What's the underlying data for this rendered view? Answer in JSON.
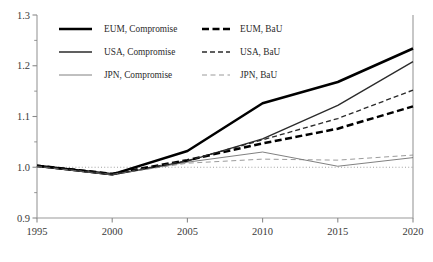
{
  "chart_data": {
    "type": "line",
    "title": "",
    "xlabel": "",
    "ylabel": "",
    "xlim": [
      1995,
      2020
    ],
    "ylim": [
      0.9,
      1.3
    ],
    "grid": false,
    "legend_position": "top-left",
    "x_ticks": [
      "1995",
      "2000",
      "2005",
      "2010",
      "2015",
      "2020"
    ],
    "x_tick_values": [
      1995,
      2000,
      2005,
      2010,
      2015,
      2020
    ],
    "y_ticks": [
      "0.9",
      "1.0",
      "1.1",
      "1.2",
      "1.3"
    ],
    "y_tick_values": [
      0.9,
      1.0,
      1.1,
      1.2,
      1.3
    ],
    "y_minor_tick_values": [
      0.95,
      1.05,
      1.15,
      1.25
    ],
    "reference_line": {
      "value": 1.0,
      "style": "dotted"
    },
    "x": [
      1995,
      2000,
      2005,
      2010,
      2015,
      2020
    ],
    "series": [
      {
        "name": "EUM, Compromise",
        "style": "solid",
        "width": "thick",
        "color": "#000000",
        "values": [
          1.003,
          0.986,
          1.032,
          1.126,
          1.168,
          1.234
        ]
      },
      {
        "name": "USA, Compromise",
        "style": "solid",
        "width": "medium",
        "color": "#2b2b2b",
        "values": [
          1.002,
          0.985,
          1.012,
          1.056,
          1.122,
          1.208
        ]
      },
      {
        "name": "JPN, Compromise",
        "style": "solid",
        "width": "thin",
        "color": "#555555",
        "values": [
          1.001,
          0.985,
          1.01,
          1.03,
          1.002,
          1.019
        ]
      },
      {
        "name": "EUM, BaU",
        "style": "dashed",
        "width": "thick",
        "color": "#000000",
        "values": [
          1.003,
          0.987,
          1.014,
          1.047,
          1.076,
          1.12
        ]
      },
      {
        "name": "USA, BaU",
        "style": "dashed",
        "width": "medium",
        "color": "#2b2b2b",
        "values": [
          1.002,
          0.986,
          1.013,
          1.054,
          1.096,
          1.152
        ]
      },
      {
        "name": "JPN, BaU",
        "style": "dashed",
        "width": "thin",
        "color": "#7a7a7a",
        "values": [
          1.001,
          0.986,
          1.008,
          1.016,
          1.014,
          1.024
        ]
      }
    ]
  },
  "legend": {
    "entries": [
      {
        "label": "EUM, Compromise",
        "column": 0,
        "row": 0
      },
      {
        "label": "USA, Compromise",
        "column": 0,
        "row": 1
      },
      {
        "label": "JPN, Compromise",
        "column": 0,
        "row": 2
      },
      {
        "label": "EUM, BaU",
        "column": 1,
        "row": 0
      },
      {
        "label": "USA, BaU",
        "column": 1,
        "row": 1
      },
      {
        "label": "JPN, BaU",
        "column": 1,
        "row": 2
      }
    ]
  },
  "axes": {
    "frame_color": "#9a9a9a",
    "tick_color": "#8a8a8a"
  }
}
